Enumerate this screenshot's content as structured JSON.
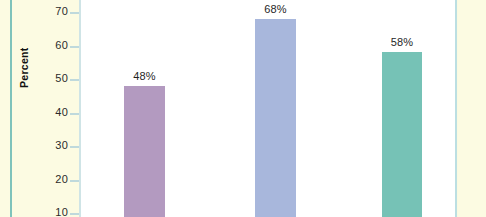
{
  "chart_data": {
    "type": "bar",
    "title": "",
    "subtitle": "",
    "xlabel": "",
    "ylabel": "Percent",
    "ylim": [
      0,
      75
    ],
    "grid": false,
    "legend": null,
    "y_ticks": [
      70,
      60,
      50,
      40,
      30,
      20,
      10
    ],
    "y_tick_labels": [
      "70",
      "60",
      "50",
      "40",
      "30",
      "20",
      "10"
    ],
    "categories": [
      "",
      "",
      ""
    ],
    "values": [
      48,
      68,
      58
    ],
    "data_labels": [
      "48%",
      "68%",
      "58%"
    ],
    "bar_colors": [
      "#b39ac0",
      "#a8b7dc",
      "#76c2b6"
    ],
    "note": "cropped bar chart; category axis labels not visible in frame"
  },
  "figure": {
    "plot_background": "#ffffff",
    "page_background": "#fcfbe2",
    "axis_color": "#cfe4e6",
    "frame_rule_left_color": "#7fc3bb",
    "frame_rule_right_color": "#bcdfe2",
    "axis_title": "Percent"
  },
  "ticks": [
    {
      "label": "70",
      "top": 5
    },
    {
      "label": "60",
      "top": 39
    },
    {
      "label": "50",
      "top": 72
    },
    {
      "label": "40",
      "top": 106
    },
    {
      "label": "30",
      "top": 139
    },
    {
      "label": "20",
      "top": 173
    },
    {
      "label": "10",
      "top": 206
    }
  ],
  "bars": [
    {
      "label": "48%",
      "value": 48,
      "color": "#b39ac0",
      "left": 124,
      "width": 41,
      "top": 86,
      "label_left": 112,
      "label_top": 70
    },
    {
      "label": "68%",
      "value": 68,
      "color": "#a8b7dc",
      "left": 255,
      "width": 41,
      "top": 19,
      "label_left": 243,
      "label_top": 3
    },
    {
      "label": "58%",
      "value": 58,
      "color": "#76c2b6",
      "left": 382,
      "width": 40,
      "top": 52,
      "label_left": 370,
      "label_top": 36
    }
  ]
}
